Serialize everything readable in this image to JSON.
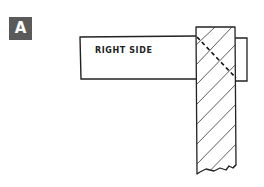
{
  "figure": {
    "panel_label": "A",
    "board_label": "RIGHT SIDE",
    "colors": {
      "label_bg": "#5a5a5a",
      "label_fg": "#ffffff",
      "ink": "#222222",
      "background": "#ffffff"
    }
  }
}
